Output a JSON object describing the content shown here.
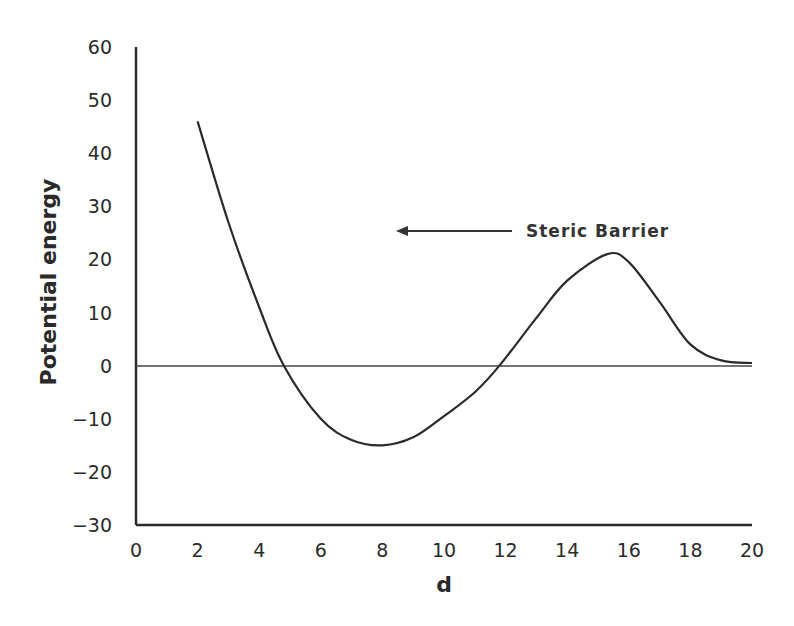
{
  "chart_data": {
    "type": "line",
    "title": "",
    "xlabel": "d",
    "ylabel": "Potential energy",
    "xlim": [
      0,
      20
    ],
    "ylim": [
      -30,
      60
    ],
    "x_ticks": [
      "0",
      "2",
      "4",
      "6",
      "8",
      "10",
      "12",
      "14",
      "16",
      "18",
      "20"
    ],
    "y_ticks": [
      "60",
      "50",
      "40",
      "30",
      "20",
      "10",
      "0",
      "-10",
      "-20",
      "-30"
    ],
    "grid": false,
    "legend": null,
    "annotations": [
      {
        "text": "Steric Barrier",
        "arrow": "left-pointing arrow",
        "position_x": 8.5,
        "position_y": 26
      }
    ],
    "reference_lines": [
      {
        "type": "horizontal",
        "y": 0
      }
    ],
    "series": [
      {
        "name": "Potential energy",
        "x": [
          2,
          3,
          4,
          4.8,
          6,
          7,
          8,
          9,
          10,
          11,
          11.8,
          13,
          14,
          15.3,
          16,
          17,
          18,
          19,
          20
        ],
        "y": [
          46,
          27,
          11,
          0,
          -10,
          -14,
          -15,
          -13.5,
          -9.5,
          -5,
          0,
          9,
          16,
          21,
          19.5,
          12,
          4,
          1,
          0.5
        ]
      }
    ]
  },
  "labels": {
    "xlabel": "d",
    "ylabel": "Potential energy",
    "annotation": "Steric Barrier"
  },
  "colors": {
    "line": "#2a2a2a",
    "background": "#ffffff"
  }
}
